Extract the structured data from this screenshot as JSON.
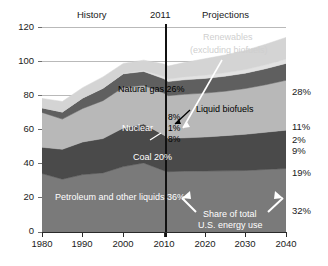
{
  "header": {
    "history_label": "History",
    "year_divider_label": "2011",
    "projections_label": "Projections"
  },
  "chart_data": {
    "type": "area",
    "title": "",
    "xlabel": "",
    "ylabel": "",
    "xlim": [
      1980,
      2040
    ],
    "ylim": [
      0,
      120
    ],
    "grid": true,
    "legend": "in-plot annotations",
    "x_ticks": [
      "1980",
      "1990",
      "2000",
      "2010",
      "2020",
      "2030",
      "2040"
    ],
    "y_ticks": [
      "0",
      "20",
      "40",
      "60",
      "80",
      "100",
      "120"
    ],
    "x": [
      1980,
      1985,
      1990,
      1995,
      2000,
      2005,
      2010,
      2011,
      2015,
      2020,
      2025,
      2030,
      2035,
      2040
    ],
    "series": [
      {
        "name": "Petroleum and other liquids",
        "color": "#7a7a7a",
        "values": [
          34.2,
          30.9,
          33.6,
          34.6,
          38.3,
          40.4,
          35.9,
          35.3,
          35.6,
          35.7,
          35.8,
          36.0,
          36.6,
          37.2
        ]
      },
      {
        "name": "Coal",
        "color": "#4a4a4a",
        "values": [
          15.4,
          17.5,
          19.1,
          20.1,
          22.6,
          22.8,
          20.8,
          19.6,
          19.5,
          19.9,
          20.6,
          21.2,
          21.8,
          22.4
        ]
      },
      {
        "name": "Natural gas",
        "color": "#b8b8b8",
        "values": [
          20.4,
          17.7,
          19.6,
          22.2,
          23.8,
          22.6,
          24.6,
          24.9,
          25.5,
          25.7,
          26.0,
          26.8,
          27.8,
          29.2
        ]
      },
      {
        "name": "Nuclear",
        "color": "#5f5f5f",
        "values": [
          2.7,
          4.1,
          6.1,
          7.2,
          7.9,
          8.2,
          8.4,
          8.3,
          8.5,
          8.6,
          8.8,
          9.0,
          9.4,
          9.9
        ]
      },
      {
        "name": "Liquid biofuels",
        "color": "#e2e2e2",
        "values": [
          0.0,
          0.1,
          0.1,
          0.2,
          0.3,
          0.6,
          1.3,
          1.4,
          1.7,
          1.9,
          2.0,
          2.1,
          2.3,
          2.6
        ]
      },
      {
        "name": "Renewables (excluding biofuels)",
        "color": "#d4d4d4",
        "values": [
          5.5,
          6.1,
          6.0,
          6.5,
          5.8,
          6.0,
          7.3,
          7.6,
          8.4,
          9.6,
          10.4,
          11.2,
          12.0,
          12.6
        ]
      }
    ],
    "annotations": [
      {
        "text": "Natural gas 26%",
        "color": "black"
      },
      {
        "text": "Nuclear",
        "color": "white"
      },
      {
        "text": "Coal 20%",
        "color": "white"
      },
      {
        "text": "Petroleum and other liquids  36%",
        "color": "white"
      },
      {
        "text": "Renewables",
        "color": "grey"
      },
      {
        "text": "(excluding biofuels)",
        "color": "grey"
      },
      {
        "text": "Liquid biofuels",
        "color": "black"
      },
      {
        "text": "Share of total",
        "color": "white"
      },
      {
        "text": "U.S. energy use",
        "color": "white"
      }
    ],
    "center_share_labels": [
      "8%",
      "1%",
      "8%"
    ],
    "right_share_labels": [
      "28%",
      "11%",
      "2%",
      "9%",
      "19%",
      "32%"
    ]
  },
  "plot": {
    "natural_gas_label": "Natural gas 26%",
    "nuclear_label": "Nuclear",
    "coal_label": "Coal 20%",
    "petroleum_label": "Petroleum and other liquids  36%",
    "renewables_line1": "Renewables",
    "renewables_line2": "(excluding biofuels)",
    "biofuels_label": "Liquid biofuels",
    "share_line1": "Share of total",
    "share_line2": "U.S. energy use",
    "center_renew_pct": "8%",
    "center_biofuel_pct": "1%",
    "center_nuclear_pct": "8%",
    "right_renew_pct": "28%",
    "right_gas_pct": "11%",
    "right_biofuel_pct": "2%",
    "right_nuclear_pct": "9%",
    "right_coal_pct": "19%",
    "right_petroleum_pct": "32%"
  },
  "axes": {
    "y_ticks": [
      "120",
      "100",
      "80",
      "60",
      "40",
      "20",
      "0"
    ],
    "x_ticks": [
      "1980",
      "1990",
      "2000",
      "2010",
      "2020",
      "2030",
      "2040"
    ]
  }
}
